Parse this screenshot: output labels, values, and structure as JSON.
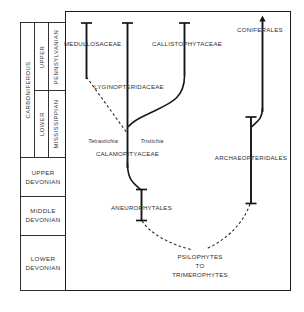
{
  "figure": {
    "stroke_color": "#161616",
    "text_color": "#2e2e2e"
  },
  "time_scale": {
    "periods": [
      {
        "name": "CARBONIFEROUS",
        "orientation": "vertical"
      }
    ],
    "epochs": [
      {
        "name": "UPPER",
        "orientation": "vertical"
      },
      {
        "name": "LOWER",
        "orientation": "vertical"
      }
    ],
    "subperiods": [
      {
        "name": "PENNSYLVANIAN",
        "orientation": "vertical"
      },
      {
        "name": "MISSISSIPPIAN",
        "orientation": "vertical"
      }
    ],
    "devonian": [
      {
        "line1": "UPPER",
        "line2": "DEVONIAN"
      },
      {
        "line1": "MIDDLE",
        "line2": "DEVONIAN"
      },
      {
        "line1": "LOWER",
        "line2": "DEVONIAN"
      }
    ]
  },
  "taxa": {
    "medullosaceae": "MEDULLOSACEAE",
    "callistophytaceae": "CALLISTOPHYTACEAE",
    "coniferales": "CONIFERALES",
    "lyginopteridaceae": "LYGINOPTERIDACEAE",
    "calamopityaceae": "CALAMOPITYACEAE",
    "archaeopteridales": "ARCHAEOPTERIDALES",
    "aneurophytales": "ANEUROPHYTALES",
    "psilophytes_line1": "PSILOPHYTES",
    "psilophytes_line2": "TO",
    "psilophytes_line3": "TRIMEROPHYTES"
  },
  "genera": {
    "tetrastichia": "Tetrastichia",
    "tristichia": "Tristichia"
  }
}
